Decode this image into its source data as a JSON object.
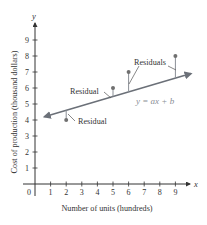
{
  "chart_data": {
    "type": "scatter",
    "title": "",
    "xlabel": "Number of units (hundreds)",
    "ylabel": "Cost of production (thousand dollars)",
    "x_axis_letter": "x",
    "y_axis_letter": "y",
    "origin_label": "0",
    "xticks": [
      1,
      2,
      3,
      4,
      5,
      6,
      7,
      8,
      9
    ],
    "yticks": [
      1,
      2,
      3,
      4,
      5,
      6,
      7,
      8,
      9
    ],
    "xlim": [
      0,
      10
    ],
    "ylim": [
      0,
      10
    ],
    "grid": false,
    "series": [
      {
        "name": "Data points",
        "type": "scatter",
        "points": [
          {
            "x": 2,
            "y": 4
          },
          {
            "x": 5,
            "y": 6
          },
          {
            "x": 6,
            "y": 7
          },
          {
            "x": 9,
            "y": 8
          }
        ]
      },
      {
        "name": "Regression line",
        "type": "line",
        "label": "y = ax + b",
        "endpoints": [
          {
            "x": 0.6,
            "y": 4.2
          },
          {
            "x": 10.0,
            "y": 6.9
          }
        ]
      }
    ],
    "annotations": [
      {
        "text": "Residual",
        "target_point": {
          "x": 2,
          "y": 4
        }
      },
      {
        "text": "Residual",
        "target_point": {
          "x": 5,
          "y": 6
        }
      },
      {
        "text": "Residuals",
        "target_points": [
          {
            "x": 6,
            "y": 7
          },
          {
            "x": 9,
            "y": 8
          }
        ]
      },
      {
        "text": "y = ax + b",
        "target": "Regression line"
      }
    ],
    "colors": {
      "axis": "#333333",
      "line": "#6b7078",
      "points": "#707070",
      "residual": "#8a8f96",
      "equation": "#8a8f96"
    }
  }
}
